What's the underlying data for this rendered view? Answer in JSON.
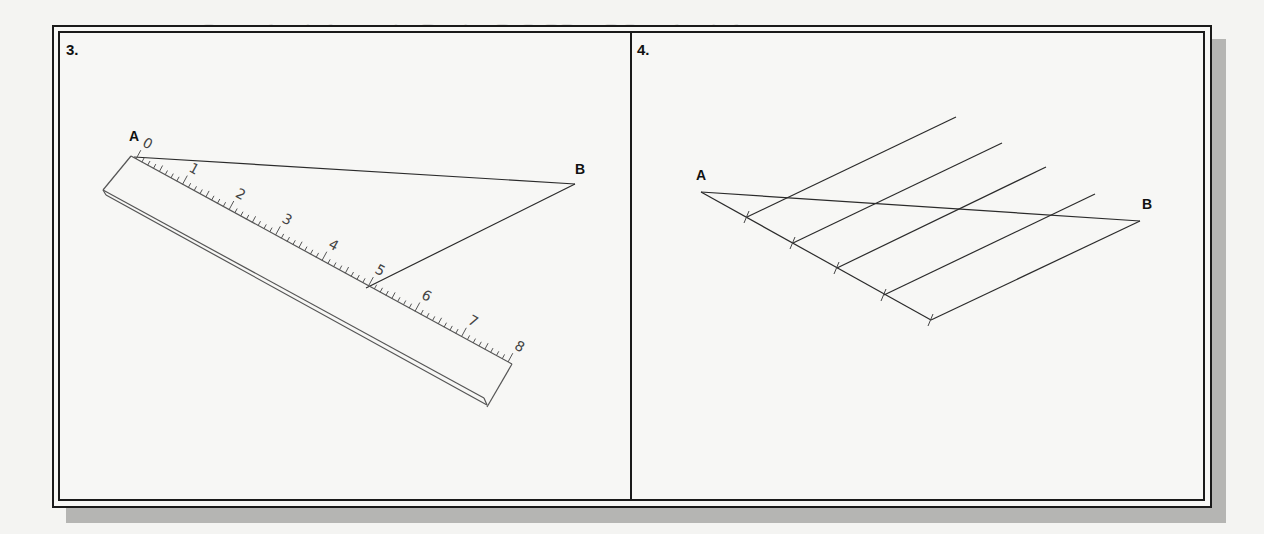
{
  "background_bleed_text": {
    "line1": "Create the circle at point D using D-C, DB or DC on the circle."
  },
  "panels": [
    {
      "number_label": "3.",
      "points": {
        "a_label": "A",
        "b_label": "B"
      },
      "ruler": {
        "numbers": [
          "0",
          "1",
          "2",
          "3",
          "4",
          "5",
          "6",
          "7",
          "8"
        ]
      }
    },
    {
      "number_label": "4.",
      "points": {
        "a_label": "A",
        "b_label": "B"
      },
      "divisions": 5
    }
  ],
  "colors": {
    "line": "#2b2b2b",
    "frame": "#1a1a1a",
    "shadow": "#b5b5b3",
    "paper": "#f7f7f5"
  }
}
